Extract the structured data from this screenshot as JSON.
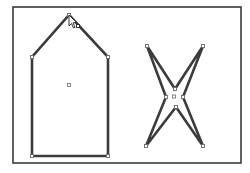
{
  "artboard": {
    "label": "artboard",
    "border_color": "#3a3a3a",
    "background": "#ffffff"
  },
  "shapes": [
    {
      "name": "pentagon-house-shape",
      "type": "polygon",
      "anchor_count": 5,
      "selected": true,
      "stroke_color": "#3c3c3c",
      "fill_color": "#ffffff"
    },
    {
      "name": "four-point-star-shape",
      "type": "star",
      "points": 4,
      "anchor_count": 8,
      "selected": true,
      "stroke_color": "#3c3c3c",
      "fill_color": "#ffffff"
    }
  ],
  "cursor": {
    "icon": "direct-selection-anchor-cursor-icon"
  }
}
